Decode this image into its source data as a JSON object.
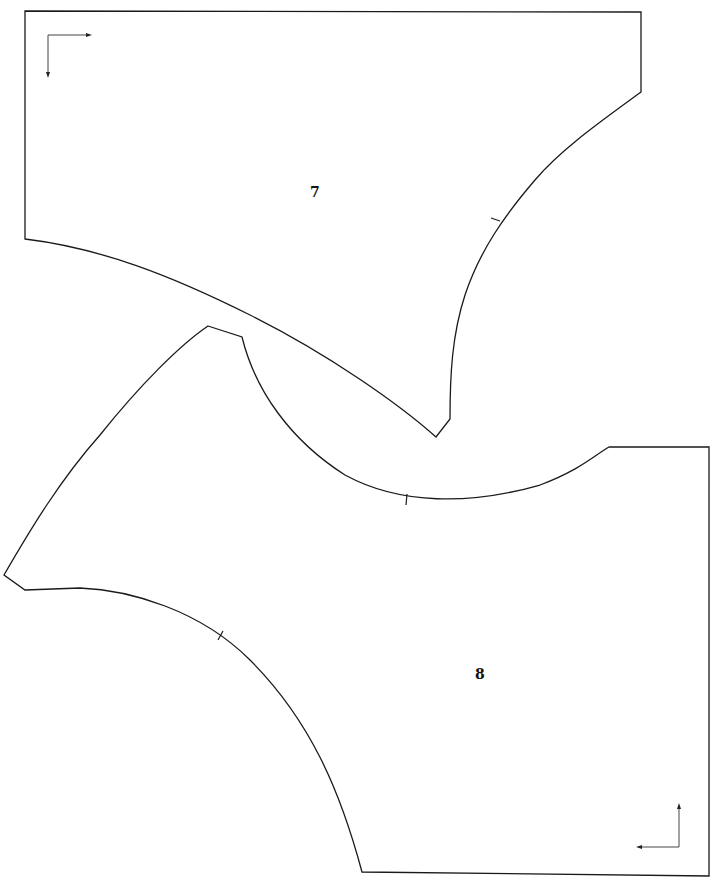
{
  "pattern": {
    "pieces": [
      {
        "id": "piece-7",
        "label": "7",
        "grainline": "top-left corner, arrows right and down"
      },
      {
        "id": "piece-8",
        "label": "8",
        "grainline": "bottom-right corner, arrows up and left"
      }
    ],
    "colors": {
      "background": "#ffffff",
      "outline": "#1a1a1a"
    }
  }
}
